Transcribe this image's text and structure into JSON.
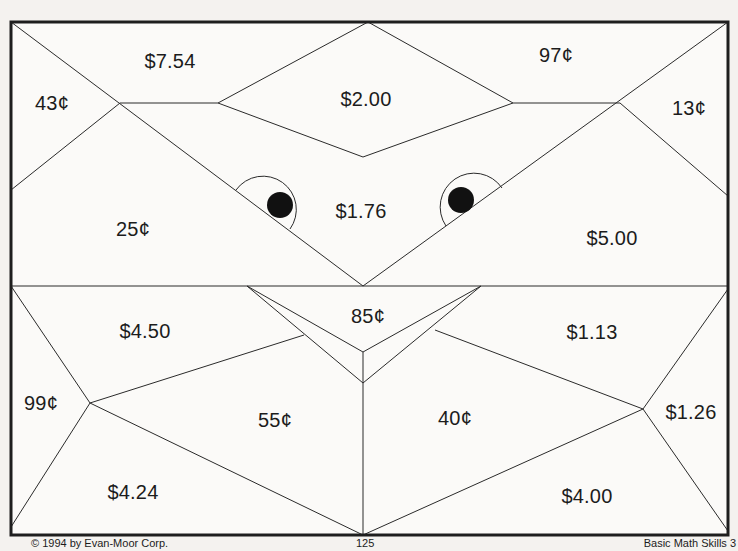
{
  "page": {
    "footer": {
      "copyright": "© 1994 by Evan-Moor Corp.",
      "page_number": "125",
      "book_title": "Basic Math Skills 3"
    }
  },
  "puzzle": {
    "colors": {
      "line": "#2a2a2a",
      "frame": "#1e1e1e",
      "paper": "#fbfaf8",
      "eye": "#111111"
    },
    "regions": [
      {
        "id": "r1",
        "label": "$7.54",
        "x": 170,
        "y": 61
      },
      {
        "id": "r2",
        "label": "43¢",
        "x": 52,
        "y": 103
      },
      {
        "id": "r3",
        "label": "$2.00",
        "x": 366,
        "y": 99
      },
      {
        "id": "r4",
        "label": "97¢",
        "x": 556,
        "y": 55
      },
      {
        "id": "r5",
        "label": "13¢",
        "x": 689,
        "y": 108
      },
      {
        "id": "r6",
        "label": "25¢",
        "x": 133,
        "y": 229
      },
      {
        "id": "r7",
        "label": "$1.76",
        "x": 361,
        "y": 211
      },
      {
        "id": "r8",
        "label": "$5.00",
        "x": 612,
        "y": 238
      },
      {
        "id": "r9",
        "label": "$4.50",
        "x": 145,
        "y": 331
      },
      {
        "id": "r10",
        "label": "85¢",
        "x": 368,
        "y": 316
      },
      {
        "id": "r11",
        "label": "$1.13",
        "x": 592,
        "y": 332
      },
      {
        "id": "r12",
        "label": "99¢",
        "x": 41,
        "y": 403
      },
      {
        "id": "r13",
        "label": "55¢",
        "x": 275,
        "y": 420
      },
      {
        "id": "r14",
        "label": "40¢",
        "x": 455,
        "y": 418
      },
      {
        "id": "r15",
        "label": "$1.26",
        "x": 691,
        "y": 412
      },
      {
        "id": "r16",
        "label": "$4.24",
        "x": 133,
        "y": 492
      },
      {
        "id": "r17",
        "label": "$4.00",
        "x": 587,
        "y": 496
      }
    ]
  }
}
